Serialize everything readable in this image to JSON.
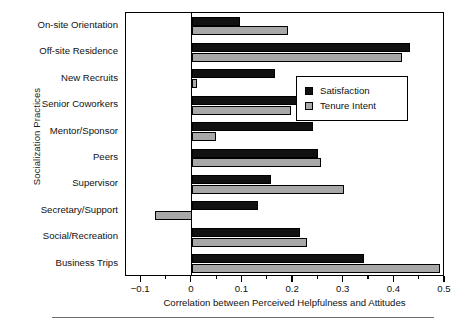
{
  "chart_data": {
    "type": "bar",
    "orientation": "horizontal",
    "title": "",
    "xlabel": "Correlation between Perceived Helpfulness and Attitudes",
    "ylabel": "Socialization Practices",
    "xlim": [
      -0.13,
      0.5
    ],
    "xticks": [
      -0.1,
      0,
      0.1,
      0.2,
      0.3,
      0.4,
      0.5
    ],
    "xticklabels": [
      "−0.1",
      "0",
      "0.1",
      "0.2",
      "0.3",
      "0.4",
      "0.5"
    ],
    "minor_ticks": [
      -0.05,
      0.05,
      0.15,
      0.25,
      0.35,
      0.45
    ],
    "grid": false,
    "legend_position": "center right",
    "categories": [
      "On-site Orientation",
      "Off-site Residence",
      "New Recruits",
      "Senior Coworkers",
      "Mentor/Sponsor",
      "Peers",
      "Supervisor",
      "Secretary/Support",
      "Social/Recreation",
      "Business Trips"
    ],
    "series": [
      {
        "name": "Satisfaction",
        "color": "#111111",
        "values": [
          0.095,
          0.43,
          0.165,
          0.225,
          0.24,
          0.25,
          0.157,
          0.13,
          0.213,
          0.34
        ]
      },
      {
        "name": "Tenure Intent",
        "color": "#a8a8a8",
        "values": [
          0.19,
          0.415,
          0.01,
          0.195,
          0.047,
          0.255,
          0.3,
          -0.073,
          0.227,
          0.49
        ]
      }
    ]
  },
  "legend": {
    "items": [
      {
        "label": "Satisfaction",
        "swatch": "sat"
      },
      {
        "label": "Tenure Intent",
        "swatch": "ten"
      }
    ]
  }
}
